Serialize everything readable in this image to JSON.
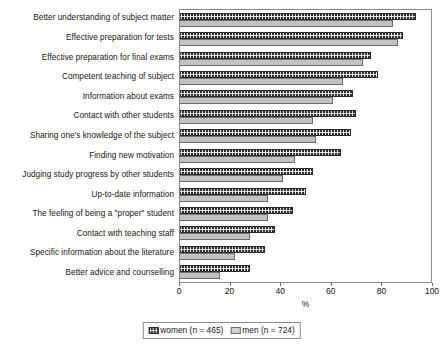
{
  "chart_data": {
    "type": "bar",
    "orientation": "horizontal",
    "title": "",
    "xlabel": "%",
    "ylabel": "",
    "xlim": [
      0,
      100
    ],
    "xticks": [
      0,
      20,
      40,
      60,
      80,
      100
    ],
    "grid": false,
    "legend_position": "bottom",
    "categories": [
      "Better understanding of subject matter",
      "Effective preparation for tests",
      "Effective preparation for final exams",
      "Competent teaching of subject",
      "Information about exams",
      "Contact with other students",
      "Sharing one's knowledge of the subject",
      "Finding new motivation",
      "Judging study progress by other students",
      "Up-to-date information",
      "The feeling of being a \"proper\" student",
      "Contact with teaching staff",
      "Specific information about the literature",
      "Better advice and counselling"
    ],
    "series": [
      {
        "name": "women (n = 465)",
        "key": "women",
        "color": "#2e2e2e",
        "pattern": "checkered",
        "values": [
          94,
          89,
          76,
          79,
          69,
          70,
          68,
          64,
          53,
          50,
          45,
          38,
          34,
          28
        ]
      },
      {
        "name": "men (n = 724)",
        "key": "men",
        "color": "#c2c2c2",
        "pattern": "solid-light",
        "values": [
          85,
          87,
          73,
          65,
          61,
          53,
          54,
          46,
          41,
          35,
          35,
          28,
          22,
          16
        ]
      }
    ]
  },
  "legend": {
    "entries": [
      {
        "label": "women (n = 465)"
      },
      {
        "label": "men (n = 724)"
      }
    ]
  },
  "axis": {
    "x_title": "%",
    "tick_labels": [
      "0",
      "20",
      "40",
      "60",
      "80",
      "100"
    ]
  }
}
